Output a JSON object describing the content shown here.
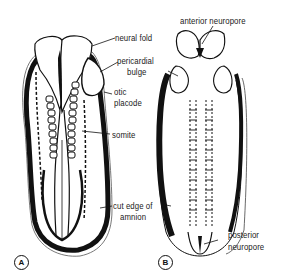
{
  "figure": {
    "panels": [
      {
        "id": "A",
        "label": "A"
      },
      {
        "id": "B",
        "label": "B"
      }
    ],
    "labels": {
      "neural_fold": "neural fold",
      "pericardial_bulge_line1": "pericardial",
      "pericardial_bulge_line2": "bulge",
      "otic_placode_line1": "otic",
      "otic_placode_line2": "placode",
      "somite": "somite",
      "cut_edge_line1": "cut edge of",
      "cut_edge_line2": "amnion",
      "anterior_neuropore": "anterior neuropore",
      "posterior_neuropore_line1": "posterior",
      "posterior_neuropore_line2": "neuropore"
    },
    "colors": {
      "ink": "#111111",
      "background": "#ffffff"
    }
  }
}
